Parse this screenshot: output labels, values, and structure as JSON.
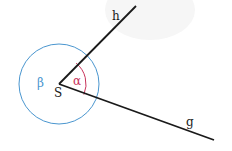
{
  "diagram": {
    "title": "",
    "vertex": {
      "label": "S",
      "x": 59,
      "y": 84
    },
    "rays": [
      {
        "label": "h",
        "end_x": 136,
        "end_y": 6,
        "label_x": 115,
        "label_y": 20
      },
      {
        "label": "g",
        "end_x": 214,
        "end_y": 140,
        "label_x": 189,
        "label_y": 126
      }
    ],
    "angles": [
      {
        "label": "α",
        "description": "interior angle between h and g",
        "color": "#c8325a",
        "radius": 27,
        "label_x": 77,
        "label_y": 85
      },
      {
        "label": "β",
        "description": "reflex angle (full circle remainder)",
        "color": "#4a96cf",
        "radius": 40,
        "label_x": 41,
        "label_y": 87
      }
    ],
    "line_color": "#1a1a1a"
  }
}
